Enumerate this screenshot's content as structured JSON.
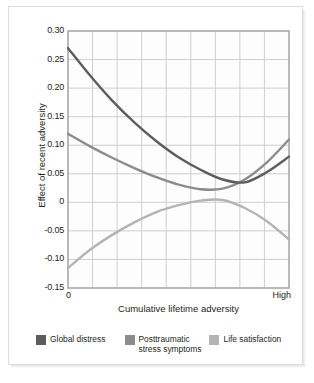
{
  "chart_data": {
    "type": "line",
    "title": "",
    "xlabel": "Cumulative lifetime adversity",
    "ylabel": "Effect of recent adversity",
    "xtick_labels": [
      "0",
      "High"
    ],
    "ytick_labels": [
      "0.30",
      "0.25",
      "0.20",
      "0.15",
      "0.10",
      "0.05",
      "0",
      "-0.05",
      "-0.10",
      "-0.15"
    ],
    "ylim": [
      -0.15,
      0.3
    ],
    "xlim": [
      0,
      1
    ],
    "grid": true,
    "grid_columns": 9,
    "grid_rows": 9,
    "legend_position": "below",
    "x": [
      0,
      0.1,
      0.2,
      0.3,
      0.4,
      0.5,
      0.6,
      0.7,
      0.8,
      0.9,
      1.0
    ],
    "series": [
      {
        "name": "Global distress",
        "color": "#5d5d5d",
        "values": [
          0.27,
          0.222,
          0.178,
          0.14,
          0.107,
          0.079,
          0.057,
          0.04,
          0.035,
          0.053,
          0.08
        ]
      },
      {
        "name": "Posttraumatic\nstress symptoms",
        "color": "#8c8c8c",
        "values": [
          0.12,
          0.098,
          0.078,
          0.06,
          0.044,
          0.031,
          0.023,
          0.024,
          0.04,
          0.07,
          0.11
        ]
      },
      {
        "name": "Life satisfaction",
        "color": "#b4b4b4",
        "values": [
          -0.115,
          -0.083,
          -0.057,
          -0.035,
          -0.017,
          -0.005,
          0.003,
          0.004,
          -0.01,
          -0.033,
          -0.065
        ]
      }
    ]
  },
  "axes": {
    "y_ticks": [
      {
        "label": "0.30",
        "value": 0.3
      },
      {
        "label": "0.25",
        "value": 0.25
      },
      {
        "label": "0.20",
        "value": 0.2
      },
      {
        "label": "0.15",
        "value": 0.15
      },
      {
        "label": "0.10",
        "value": 0.1
      },
      {
        "label": "0.05",
        "value": 0.05
      },
      {
        "label": "0",
        "value": 0
      },
      {
        "label": "-0.05",
        "value": -0.05
      },
      {
        "label": "-0.10",
        "value": -0.1
      },
      {
        "label": "-0.15",
        "value": -0.15
      }
    ],
    "x_ticks": [
      {
        "label": "0",
        "value": 0
      },
      {
        "label": "High",
        "value": 1
      }
    ],
    "y_axis_title": "Effect of recent adversity",
    "x_axis_title": "Cumulative lifetime adversity"
  },
  "legend": {
    "items": [
      {
        "label": "Global distress",
        "color": "#5d5d5d"
      },
      {
        "label": "Posttraumatic\nstress symptoms",
        "color": "#8c8c8c"
      },
      {
        "label": "Life satisfaction",
        "color": "#b4b4b4"
      }
    ]
  },
  "colors": {
    "grid": "#c9c9c9",
    "frame": "#a9a9a9",
    "text": "#231f20",
    "background": "#ffffff"
  }
}
